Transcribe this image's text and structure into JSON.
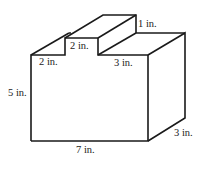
{
  "figure": {
    "type": "3d-solid",
    "labels": {
      "top_height": "1 in.",
      "notch_width": "2 in.",
      "left_step": "2 in.",
      "right_step": "3 in.",
      "height": "5 in.",
      "length": "7 in.",
      "depth": "3 in."
    },
    "colors": {
      "stroke": "#1a1a1a",
      "background": "#ffffff"
    }
  }
}
